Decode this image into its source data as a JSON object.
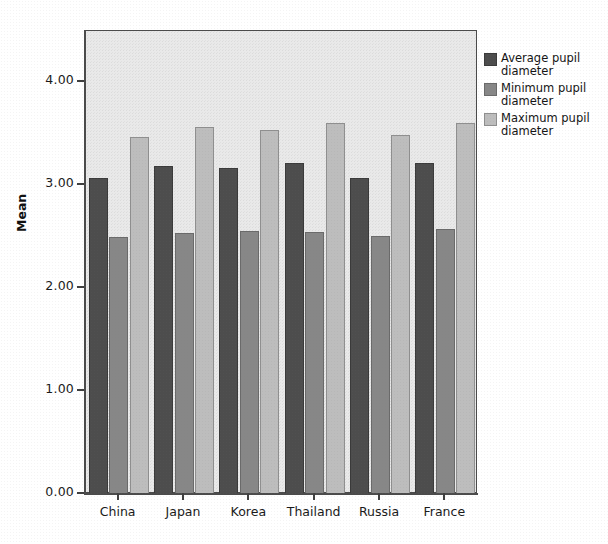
{
  "chart_data": {
    "type": "bar",
    "title": "",
    "xlabel": "",
    "ylabel": "Mean",
    "ylim": [
      0.0,
      4.5
    ],
    "grid": false,
    "legend_position": "right",
    "categories": [
      "China",
      "Japan",
      "Korea",
      "Thailand",
      "Russia",
      "France"
    ],
    "ytick_labels": [
      "0.00",
      "1.00",
      "2.00",
      "3.00",
      "4.00"
    ],
    "ytick_values": [
      0.0,
      1.0,
      2.0,
      3.0,
      4.0
    ],
    "series": [
      {
        "name": "Average pupil diameter",
        "color": "#4d4d4d",
        "values": [
          3.07,
          3.19,
          3.17,
          3.22,
          3.07,
          3.22
        ]
      },
      {
        "name": "Minimum pupil diameter",
        "color": "#878787",
        "values": [
          2.5,
          2.54,
          2.56,
          2.55,
          2.51,
          2.58
        ]
      },
      {
        "name": "Maximum pupil diameter",
        "color": "#bdbdbd",
        "values": [
          3.47,
          3.57,
          3.54,
          3.61,
          3.49,
          3.61
        ]
      }
    ]
  },
  "axis": {
    "y_title": "Mean"
  },
  "legend": {
    "items": [
      {
        "label": "Average pupil diameter",
        "color": "#4d4d4d"
      },
      {
        "label": "Minimum pupil diameter",
        "color": "#878787"
      },
      {
        "label": "Maximum pupil diameter",
        "color": "#bdbdbd"
      }
    ]
  }
}
